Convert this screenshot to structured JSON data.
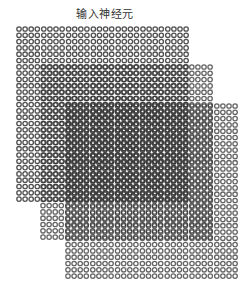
{
  "figure": {
    "title": "输入神经元",
    "neuron_color": "#333333",
    "layers": [
      {
        "name": "input-layer-1",
        "rows": 28,
        "cols": 28
      },
      {
        "name": "input-layer-2",
        "rows": 28,
        "cols": 28
      },
      {
        "name": "input-layer-3",
        "rows": 28,
        "cols": 28
      }
    ]
  }
}
